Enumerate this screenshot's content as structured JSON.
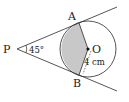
{
  "diagram": {
    "points": {
      "P": {
        "label": "P",
        "x": 17,
        "y": 49
      },
      "O": {
        "label": "O",
        "x": 88,
        "y": 49
      },
      "A": {
        "label": "A",
        "x": 79,
        "y": 23
      },
      "B": {
        "label": "B",
        "x": 79,
        "y": 75
      }
    },
    "angle_label": "45°",
    "radius_label": "4 cm",
    "circle": {
      "cx": 88,
      "cy": 49,
      "r": 28
    },
    "colors": {
      "stroke": "#2a2a2a",
      "shade": "#c8c8c8",
      "background": "#ffffff"
    }
  }
}
